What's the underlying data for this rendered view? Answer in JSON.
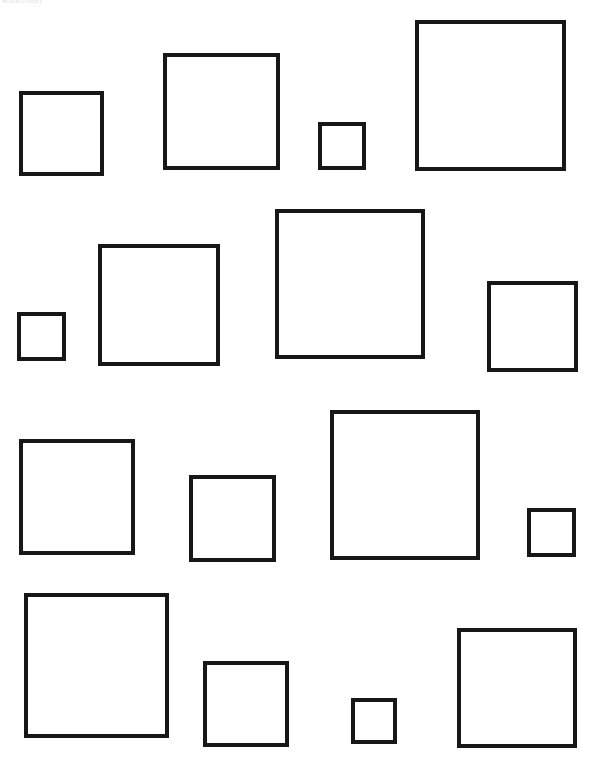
{
  "page": {
    "width": 597,
    "height": 768,
    "background_color": "#ffffff",
    "stroke_color": "#171717",
    "header_text": "worksheet"
  },
  "chart_data": {
    "type": "scatter",
    "title": "",
    "xlabel": "",
    "ylabel": "",
    "grid": false,
    "legend": null,
    "xlim": [
      0,
      597
    ],
    "ylim": [
      0,
      768
    ],
    "categories": [
      "row-1-square-1",
      "row-1-square-2",
      "row-1-square-3",
      "row-1-square-4",
      "row-2-square-1",
      "row-2-square-2",
      "row-2-square-3",
      "row-2-square-4",
      "row-3-square-1",
      "row-3-square-2",
      "row-3-square-3",
      "row-3-square-4",
      "row-4-square-1",
      "row-4-square-2",
      "row-4-square-3",
      "row-4-square-4"
    ],
    "values": [
      85,
      117,
      48,
      151,
      49,
      122,
      150,
      91,
      116,
      87,
      150,
      49,
      145,
      86,
      46,
      120
    ]
  },
  "shapes": [
    {
      "name": "row-1-square-1",
      "row": 1,
      "index": 1,
      "x": 19,
      "y": 91,
      "size": 85,
      "stroke": 4
    },
    {
      "name": "row-1-square-2",
      "row": 1,
      "index": 2,
      "x": 163,
      "y": 53,
      "size": 117,
      "stroke": 4
    },
    {
      "name": "row-1-square-3",
      "row": 1,
      "index": 3,
      "x": 318,
      "y": 122,
      "size": 48,
      "stroke": 4
    },
    {
      "name": "row-1-square-4",
      "row": 1,
      "index": 4,
      "x": 415,
      "y": 20,
      "size": 151,
      "stroke": 4
    },
    {
      "name": "row-2-square-1",
      "row": 2,
      "index": 1,
      "x": 17,
      "y": 312,
      "size": 49,
      "stroke": 4
    },
    {
      "name": "row-2-square-2",
      "row": 2,
      "index": 2,
      "x": 98,
      "y": 244,
      "size": 122,
      "stroke": 4
    },
    {
      "name": "row-2-square-3",
      "row": 2,
      "index": 3,
      "x": 275,
      "y": 209,
      "size": 150,
      "stroke": 4
    },
    {
      "name": "row-2-square-4",
      "row": 2,
      "index": 4,
      "x": 487,
      "y": 281,
      "size": 91,
      "stroke": 4
    },
    {
      "name": "row-3-square-1",
      "row": 3,
      "index": 1,
      "x": 19,
      "y": 439,
      "size": 116,
      "stroke": 4
    },
    {
      "name": "row-3-square-2",
      "row": 3,
      "index": 2,
      "x": 189,
      "y": 475,
      "size": 87,
      "stroke": 4
    },
    {
      "name": "row-3-square-3",
      "row": 3,
      "index": 3,
      "x": 330,
      "y": 410,
      "size": 150,
      "stroke": 4
    },
    {
      "name": "row-3-square-4",
      "row": 3,
      "index": 4,
      "x": 527,
      "y": 508,
      "size": 49,
      "stroke": 4
    },
    {
      "name": "row-4-square-1",
      "row": 4,
      "index": 1,
      "x": 24,
      "y": 593,
      "size": 145,
      "stroke": 4
    },
    {
      "name": "row-4-square-2",
      "row": 4,
      "index": 2,
      "x": 203,
      "y": 661,
      "size": 86,
      "stroke": 4
    },
    {
      "name": "row-4-square-3",
      "row": 4,
      "index": 3,
      "x": 351,
      "y": 698,
      "size": 46,
      "stroke": 4
    },
    {
      "name": "row-4-square-4",
      "row": 4,
      "index": 4,
      "x": 457,
      "y": 628,
      "size": 120,
      "stroke": 4
    }
  ]
}
